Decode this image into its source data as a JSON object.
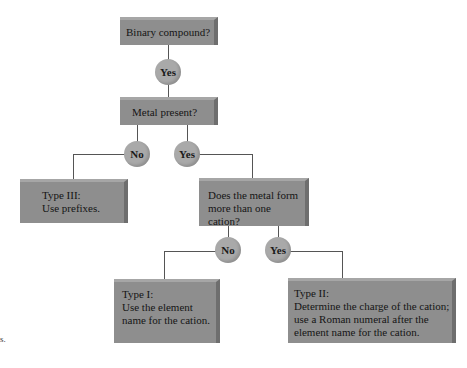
{
  "diagram": {
    "nodes": {
      "binary": {
        "label": "Binary compound?"
      },
      "metal": {
        "label": "Metal present?"
      },
      "multi_cation": {
        "line1": "Does the metal form",
        "line2": "more than one cation?"
      },
      "type3": {
        "line1": "Type III:",
        "line2": "Use prefixes."
      },
      "type1": {
        "line1": "Type I:",
        "line2": "Use the element",
        "line3": "name for the cation."
      },
      "type2": {
        "line1": "Type II:",
        "line2": "Determine the charge of the cation;",
        "line3": "use a Roman numeral after the",
        "line4": "element name for the cation."
      }
    },
    "edges": {
      "binary_metal": "Yes",
      "metal_type3": "No",
      "metal_multi": "Yes",
      "multi_type1": "No",
      "multi_type2": "Yes"
    },
    "edge_fragment": "s."
  }
}
